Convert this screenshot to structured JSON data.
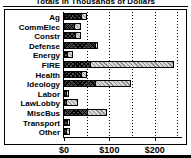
{
  "chart": {
    "title": "Totals in Thousands of Dollars",
    "xlabel": "",
    "ylabel": ""
  },
  "axis": {
    "ticks": [
      {
        "label": "$0",
        "value": 0
      },
      {
        "label": "$100",
        "value": 100
      },
      {
        "label": "$200",
        "value": 200
      }
    ],
    "gridlines": [
      0,
      50,
      100,
      150,
      200,
      250
    ]
  },
  "chart_data": {
    "type": "bar",
    "orientation": "horizontal",
    "title": "Totals in Thousands of Dollars",
    "xlabel": "",
    "ylabel": "",
    "xlim": [
      0,
      260
    ],
    "grid": true,
    "legend_position": "none",
    "categories": [
      "Ag",
      "CommElec",
      "Constr",
      "Defense",
      "Energy",
      "FIRE",
      "Health",
      "Ideology",
      "Labor",
      "LawLobby",
      "MiscBus",
      "Transport",
      "Other"
    ],
    "series": [
      {
        "name": "Series A",
        "pattern": "dark-crosshatch",
        "color": "#4a4a4a",
        "values": [
          40,
          24,
          26,
          70,
          9,
          59,
          40,
          71,
          6,
          7,
          52,
          9,
          4
        ]
      },
      {
        "name": "Series B",
        "pattern": "light-hatch",
        "color": "#d8d8d8",
        "values": [
          12,
          16,
          14,
          8,
          14,
          186,
          12,
          79,
          2,
          27,
          44,
          4,
          8
        ]
      }
    ],
    "totals": [
      52,
      40,
      40,
      78,
      23,
      245,
      52,
      150,
      8,
      34,
      96,
      13,
      12
    ]
  },
  "categories": [
    {
      "label": "Ag",
      "a": 40,
      "b": 12
    },
    {
      "label": "CommElec",
      "a": 24,
      "b": 16
    },
    {
      "label": "Constr",
      "a": 26,
      "b": 14
    },
    {
      "label": "Defense",
      "a": 70,
      "b": 8
    },
    {
      "label": "Energy",
      "a": 9,
      "b": 14
    },
    {
      "label": "FIRE",
      "a": 59,
      "b": 186
    },
    {
      "label": "Health",
      "a": 40,
      "b": 12
    },
    {
      "label": "Ideology",
      "a": 71,
      "b": 79
    },
    {
      "label": "Labor",
      "a": 6,
      "b": 2
    },
    {
      "label": "LawLobby",
      "a": 7,
      "b": 27
    },
    {
      "label": "MiscBus",
      "a": 52,
      "b": 44
    },
    {
      "label": "Transport",
      "a": 9,
      "b": 4
    },
    {
      "label": "Other",
      "a": 4,
      "b": 8
    }
  ]
}
